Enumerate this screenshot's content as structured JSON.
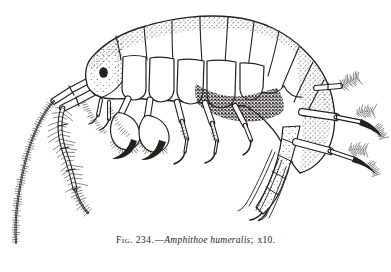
{
  "paper": {
    "background": "#ffffff",
    "ink": "#25211c"
  },
  "figure": {
    "caption": {
      "label": "Fig. 234.",
      "dash": "—",
      "species": "Amphithoe humeralis",
      "semicolon": ";",
      "magnification": "x10."
    },
    "illustration": {
      "subject": "Amphithoe humeralis amphipod, lateral line drawing at 10x magnification"
    }
  }
}
